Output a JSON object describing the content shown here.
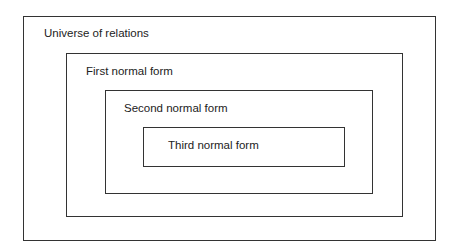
{
  "diagram": {
    "type": "nested-sets",
    "levels": [
      {
        "label": "Universe of relations"
      },
      {
        "label": "First normal form"
      },
      {
        "label": "Second normal form"
      },
      {
        "label": "Third normal form"
      }
    ]
  }
}
